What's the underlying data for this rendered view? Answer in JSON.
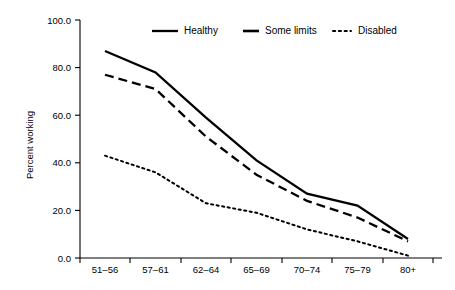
{
  "chart_data": {
    "type": "line",
    "title": "",
    "xlabel": "",
    "ylabel": "Percent working",
    "categories": [
      "51–56",
      "57–61",
      "62–64",
      "65–69",
      "70–74",
      "75–79",
      "80+"
    ],
    "ylim": [
      0.0,
      100.0
    ],
    "yticks": [
      0.0,
      20.0,
      40.0,
      60.0,
      80.0,
      100.0
    ],
    "ytick_labels": [
      "0.0",
      "20.0",
      "40.0",
      "60.0",
      "80.0",
      "100.0"
    ],
    "grid": false,
    "legend_position": "top-center",
    "series": [
      {
        "name": "Healthy",
        "style": "solid",
        "color": "#000000",
        "values": [
          87,
          78,
          59,
          41,
          27,
          22,
          8
        ]
      },
      {
        "name": "Some limits",
        "style": "dashed",
        "color": "#000000",
        "values": [
          77,
          71,
          51,
          35,
          24,
          17,
          7
        ]
      },
      {
        "name": "Disabled",
        "style": "dotted",
        "color": "#000000",
        "values": [
          43,
          36,
          23,
          19,
          12,
          7,
          1
        ]
      }
    ]
  },
  "axes": {
    "y_axis_title": "Percent working",
    "y_tick_labels": [
      "100.0",
      "80.0",
      "60.0",
      "40.0",
      "20.0",
      "0.0"
    ],
    "x_tick_labels": [
      "51–56",
      "57–61",
      "62–64",
      "65–69",
      "70–74",
      "75–79",
      "80+"
    ]
  },
  "legend": {
    "items": [
      {
        "label": "Healthy",
        "marker": "solid-line-swatch"
      },
      {
        "label": "Some limits",
        "marker": "dashed-line-swatch"
      },
      {
        "label": "Disabled",
        "marker": "dotted-line-swatch"
      }
    ]
  }
}
